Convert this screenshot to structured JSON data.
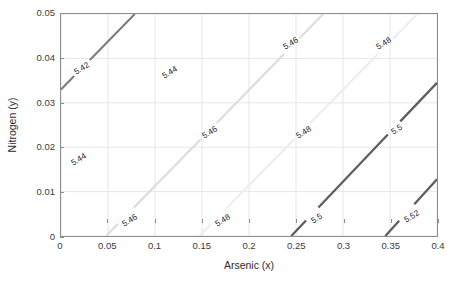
{
  "figure": {
    "background": "#ffffff",
    "axes_color": "#8c8c8c"
  },
  "axis": {
    "x": {
      "label": "Arsenic (x)",
      "min": 0,
      "max": 0.4,
      "ticks": [
        0,
        0.05,
        0.1,
        0.15,
        0.2,
        0.25,
        0.3,
        0.35,
        0.4
      ],
      "ticklabels": [
        "0",
        "0.05",
        "0.1",
        "0.15",
        "0.2",
        "0.25",
        "0.3",
        "0.35",
        "0.4"
      ]
    },
    "y": {
      "label": "Nitrogen (y)",
      "min": 0,
      "max": 0.05,
      "ticks": [
        0,
        0.01,
        0.02,
        0.03,
        0.04,
        0.05
      ],
      "ticklabels": [
        "0",
        "0.01",
        "0.02",
        "0.03",
        "0.04",
        "0.05"
      ]
    }
  },
  "chart_data": {
    "type": "line",
    "subtype": "contour",
    "title": "",
    "xlabel": "Arsenic (x)",
    "ylabel": "Nitrogen (y)",
    "xlim": [
      0,
      0.4
    ],
    "ylim": [
      0,
      0.05
    ],
    "grid": true,
    "legend": "none",
    "colormap": "gray",
    "levels": [
      5.42,
      5.44,
      5.46,
      5.48,
      5.5,
      5.52
    ],
    "level_labels": [
      "5.42",
      "5.44",
      "5.46",
      "5.48",
      "5.5",
      "5.52"
    ],
    "contours": [
      {
        "level": 5.42,
        "label": "5.42",
        "color": "#7d7d7d",
        "width": 2.1,
        "points": [
          [
            0.0,
            0.033
          ],
          [
            0.0785,
            0.05
          ]
        ],
        "labels": [
          {
            "text": "5.42",
            "x": 0.0235,
            "y": 0.0376,
            "angle": -32
          }
        ]
      },
      {
        "level": 5.44,
        "label": "5.44",
        "color": "#f2f2f2",
        "width": 2.1,
        "points": [
          [
            0.0,
            0.0
          ]
        ],
        "labels": [
          {
            "text": "5.44",
            "x": 0.0205,
            "y": 0.0172,
            "angle": -32
          },
          {
            "text": "5.44",
            "x": 0.1165,
            "y": 0.0365,
            "angle": -32
          }
        ]
      },
      {
        "level": 5.46,
        "label": "5.46",
        "color": "#dcdcdc",
        "width": 2.1,
        "points": [
          [
            0.048,
            0.0
          ],
          [
            0.279,
            0.05
          ]
        ],
        "labels": [
          {
            "text": "5.46",
            "x": 0.074,
            "y": 0.0035,
            "angle": -32
          },
          {
            "text": "5.46",
            "x": 0.159,
            "y": 0.0233,
            "angle": -32
          },
          {
            "text": "5.46",
            "x": 0.244,
            "y": 0.043,
            "angle": -32
          }
        ]
      },
      {
        "level": 5.48,
        "label": "5.48",
        "color": "#ededed",
        "width": 2.1,
        "points": [
          [
            0.147,
            0.0
          ],
          [
            0.379,
            0.05
          ]
        ],
        "labels": [
          {
            "text": "5.48",
            "x": 0.173,
            "y": 0.0035,
            "angle": -32
          },
          {
            "text": "5.48",
            "x": 0.258,
            "y": 0.0233,
            "angle": -32
          },
          {
            "text": "5.48",
            "x": 0.343,
            "y": 0.043,
            "angle": -32
          }
        ]
      },
      {
        "level": 5.5,
        "label": "5.5",
        "color": "#5e5e5e",
        "width": 2.3,
        "points": [
          [
            0.245,
            0.0
          ],
          [
            0.4,
            0.0345
          ]
        ],
        "labels": [
          {
            "text": "5.5",
            "x": 0.272,
            "y": 0.004,
            "angle": -32
          },
          {
            "text": "5.5",
            "x": 0.357,
            "y": 0.0238,
            "angle": -32
          }
        ]
      },
      {
        "level": 5.52,
        "label": "5.52",
        "color": "#5e5e5e",
        "width": 2.3,
        "points": [
          [
            0.345,
            0.0
          ],
          [
            0.4,
            0.0128
          ]
        ],
        "labels": [
          {
            "text": "5.52",
            "x": 0.372,
            "y": 0.0045,
            "angle": -32
          }
        ]
      }
    ]
  }
}
